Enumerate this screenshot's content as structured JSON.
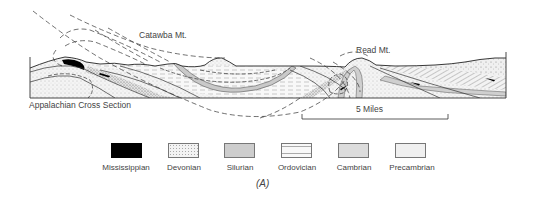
{
  "diagram": {
    "title": "Appalachian Cross Section",
    "labels": {
      "catawba": "Catawba Mt.",
      "read": "Read Mt."
    },
    "scale_bar": {
      "label": "5 Miles"
    },
    "caption": "(A)"
  },
  "legend": {
    "items": [
      {
        "label": "Mississippian",
        "pattern": "solid-black",
        "color": "#000000"
      },
      {
        "label": "Devonian",
        "pattern": "fine-stipple",
        "color": "#f2f2f2"
      },
      {
        "label": "Silurian",
        "pattern": "gray-fill",
        "color": "#cfcfcf"
      },
      {
        "label": "Ordovician",
        "pattern": "dashed-lines",
        "color": "#f6f6f6"
      },
      {
        "label": "Cambrian",
        "pattern": "dense-stipple",
        "color": "#d9d9d9"
      },
      {
        "label": "Precambrian",
        "pattern": "sparse-stipple",
        "color": "#eeeeee"
      }
    ]
  }
}
